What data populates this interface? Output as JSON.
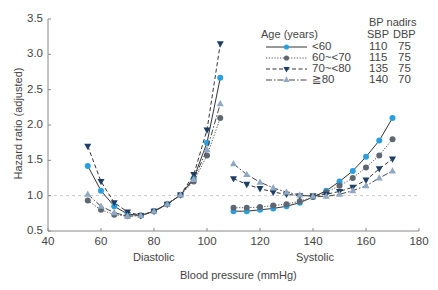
{
  "chart_data": {
    "type": "line",
    "title": "",
    "xlabel": "Blood pressure (mmHg)",
    "ylabel": "Hazard ratio (adjusted)",
    "xlim": [
      40,
      180
    ],
    "ylim": [
      0.5,
      3.5
    ],
    "x_ticks": [
      40,
      60,
      80,
      100,
      120,
      140,
      160,
      180
    ],
    "y_ticks": [
      "0.5",
      "1.0",
      "1.5",
      "2.0",
      "2.5",
      "3.0",
      "3.5"
    ],
    "grid": false,
    "reference_line": {
      "y": 1.0,
      "style": "dashed",
      "color": "#c8c8c8"
    },
    "section_labels": [
      "Diastolic",
      "Systolic"
    ],
    "legend": {
      "title": "Age (years)",
      "nadir_header": "BP nadirs",
      "nadir_columns": [
        "SBP",
        "DBP"
      ],
      "position": "upper right"
    },
    "series": [
      {
        "name": "<60",
        "color": "#2a9fe0",
        "line_color": "#333333",
        "line_style": "solid",
        "marker": "circle",
        "nadir_sbp": 110,
        "nadir_dbp": 75,
        "diastolic": {
          "x": [
            55,
            60,
            65,
            70,
            75,
            80,
            85,
            90,
            95,
            100,
            105
          ],
          "y": [
            1.42,
            1.07,
            0.85,
            0.74,
            0.72,
            0.78,
            0.88,
            1.01,
            1.25,
            1.75,
            2.67
          ]
        },
        "systolic": {
          "x": [
            110,
            115,
            120,
            125,
            130,
            135,
            140,
            145,
            150,
            155,
            160,
            165,
            170
          ],
          "y": [
            0.78,
            0.78,
            0.8,
            0.82,
            0.85,
            0.9,
            0.98,
            1.07,
            1.2,
            1.35,
            1.55,
            1.78,
            2.1
          ]
        }
      },
      {
        "name": "60~<70",
        "color": "#5f6870",
        "line_color": "#555555",
        "line_style": "dotted",
        "marker": "circle",
        "nadir_sbp": 115,
        "nadir_dbp": 75,
        "diastolic": {
          "x": [
            55,
            60,
            65,
            70,
            75,
            80,
            85,
            90,
            95,
            100,
            105
          ],
          "y": [
            0.93,
            0.8,
            0.73,
            0.71,
            0.72,
            0.78,
            0.88,
            1.01,
            1.2,
            1.57,
            2.1
          ]
        },
        "systolic": {
          "x": [
            110,
            115,
            120,
            125,
            130,
            135,
            140,
            145,
            150,
            155,
            160,
            165,
            170
          ],
          "y": [
            0.83,
            0.83,
            0.84,
            0.86,
            0.88,
            0.92,
            0.98,
            1.05,
            1.14,
            1.25,
            1.4,
            1.57,
            1.8
          ]
        }
      },
      {
        "name": "70~<80",
        "color": "#1d3f66",
        "line_color": "#333333",
        "line_style": "dashed",
        "marker": "triangle-down",
        "nadir_sbp": 135,
        "nadir_dbp": 75,
        "diastolic": {
          "x": [
            55,
            60,
            65,
            70,
            75,
            80,
            85,
            90,
            95,
            100,
            105
          ],
          "y": [
            1.7,
            1.2,
            0.9,
            0.77,
            0.72,
            0.78,
            0.88,
            1.01,
            1.3,
            1.93,
            3.15
          ]
        },
        "systolic": {
          "x": [
            110,
            115,
            120,
            125,
            130,
            135,
            140,
            145,
            150,
            155,
            160,
            165,
            170
          ],
          "y": [
            1.24,
            1.16,
            1.1,
            1.05,
            1.02,
            1.0,
            1.0,
            1.02,
            1.06,
            1.12,
            1.22,
            1.38,
            1.52
          ]
        }
      },
      {
        "name": "≧80",
        "color": "#8fa8c4",
        "line_color": "#444444",
        "line_style": "dashdot",
        "marker": "triangle-up",
        "nadir_sbp": 140,
        "nadir_dbp": 70,
        "diastolic": {
          "x": [
            55,
            60,
            65,
            70,
            75,
            80,
            85,
            90,
            95,
            100,
            105
          ],
          "y": [
            1.02,
            0.85,
            0.76,
            0.71,
            0.72,
            0.78,
            0.88,
            1.01,
            1.23,
            1.65,
            2.3
          ]
        },
        "systolic": {
          "x": [
            110,
            115,
            120,
            125,
            130,
            135,
            140,
            145,
            150,
            155,
            160,
            165,
            170
          ],
          "y": [
            1.45,
            1.3,
            1.19,
            1.11,
            1.05,
            1.01,
            0.99,
            0.99,
            1.02,
            1.07,
            1.14,
            1.25,
            1.35
          ]
        }
      }
    ]
  },
  "labels": {
    "ylabel": "Hazard ratio (adjusted)",
    "xlabel": "Blood pressure (mmHg)",
    "diastolic": "Diastolic",
    "systolic": "Systolic",
    "legend_title": "Age (years)",
    "nadir_header": "BP nadirs",
    "sbp_header": "SBP",
    "dbp_header": "DBP"
  }
}
